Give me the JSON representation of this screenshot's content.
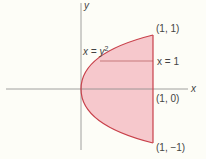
{
  "diagram": {
    "axes": {
      "x_label": "x",
      "y_label": "y"
    },
    "curve_label": {
      "lhs": "x = y",
      "exp": "2"
    },
    "line_label": "x = 1",
    "points": [
      {
        "label": "(1, 1)"
      },
      {
        "label": "(1, 0)"
      },
      {
        "label": "(1, −1)"
      }
    ],
    "colors": {
      "fill": "#f6c8cc",
      "stroke": "#c8404a",
      "axis": "#888888"
    }
  }
}
